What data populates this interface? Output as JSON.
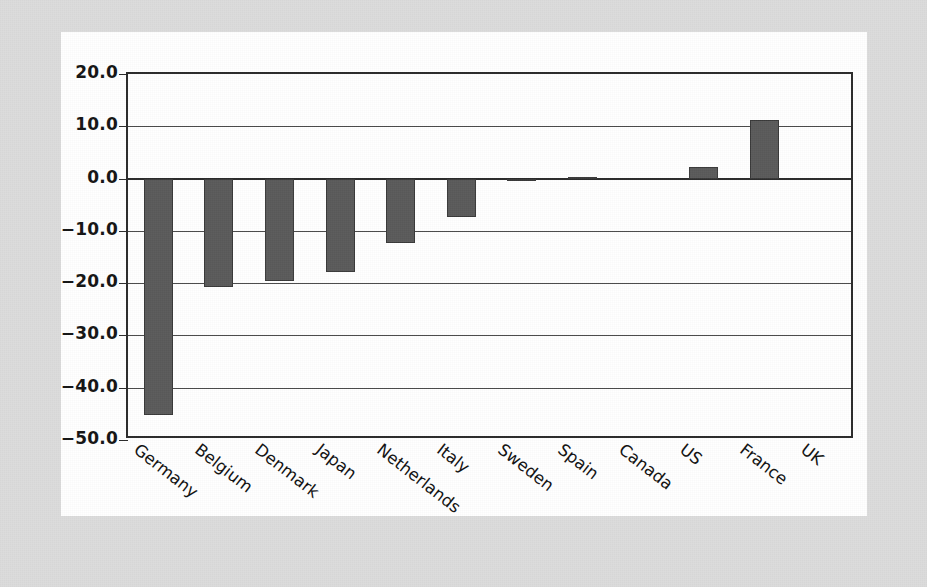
{
  "chart_data": {
    "type": "bar",
    "title": "",
    "subtitle": "",
    "xlabel": "",
    "ylabel": "",
    "categories": [
      "Germany",
      "Belgium",
      "Denmark",
      "Japan",
      "Netherlands",
      "Italy",
      "Sweden",
      "Spain",
      "Canada",
      "US",
      "France",
      "UK"
    ],
    "values": [
      -45.2,
      -20.8,
      -19.6,
      -17.8,
      -12.4,
      -7.3,
      -0.5,
      0.3,
      0.2,
      2.2,
      11.2,
      0.0
    ],
    "series": [
      {
        "name": "value",
        "values": [
          -45.2,
          -20.8,
          -19.6,
          -17.8,
          -12.4,
          -7.3,
          -0.5,
          0.3,
          0.2,
          2.2,
          11.2,
          0.0
        ]
      }
    ],
    "ylim": [
      -50.0,
      20.0
    ],
    "yticks": [
      20.0,
      10.0,
      0.0,
      -10.0,
      -20.0,
      -30.0,
      -40.0,
      -50.0
    ],
    "ytick_labels": [
      "20.0",
      "10.0",
      "0.0",
      "-10.0",
      "-20.0",
      "-30.0",
      "-40.0",
      "-50.0"
    ],
    "grid": true,
    "grid_axis": "y",
    "legend": false,
    "legend_position": "none",
    "xtick_rotation": -38,
    "bar_color": "#5a5a5a",
    "bar_edge_color": "#3a3a3a",
    "axis_color": "#2b2b2b",
    "plot_background": "#ffffff",
    "page_background": "#dcdcdc",
    "annotations": []
  }
}
